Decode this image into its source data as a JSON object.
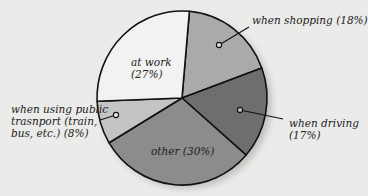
{
  "chart_data": {
    "type": "pie",
    "title": "",
    "categories": [
      "at work",
      "when shopping",
      "when driving",
      "other",
      "when using public trasnport (train, bus, etc.)"
    ],
    "values": [
      27,
      18,
      17,
      30,
      8
    ],
    "unit": "%",
    "colors": [
      "#f2f2f0",
      "#aaaaaa",
      "#6e6e6e",
      "#8c8c8c",
      "#c4c4c4"
    ],
    "start_angle_deg": 5,
    "direction": "clockwise",
    "labels": {
      "at_work": [
        "at work",
        "(27%)"
      ],
      "shopping": [
        "when shopping (18%)"
      ],
      "driving": [
        "when driving",
        "(17%)"
      ],
      "other": [
        "other (30%)"
      ],
      "transport": [
        "when using public",
        "trasnport (train,",
        "bus, etc.) (8%)"
      ]
    },
    "legend": "none (callout labels)"
  }
}
